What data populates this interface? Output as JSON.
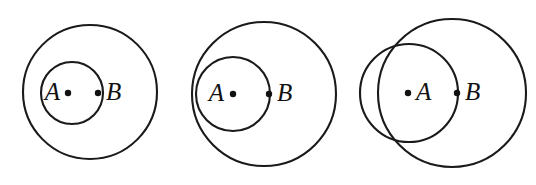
{
  "figure": {
    "background_color": "#ffffff",
    "stroke_color": "#1a1a1a",
    "label_color": "#111111",
    "width": 536,
    "height": 185,
    "panels": [
      {
        "id": "panel-1",
        "caption": "small circle inside large circle, passing through center region",
        "relationship": "nested",
        "circles": [
          {
            "name": "large-circle",
            "cx": 90,
            "cy": 92,
            "r": 67
          },
          {
            "name": "small-circle",
            "cx": 72,
            "cy": 93,
            "r": 31
          }
        ],
        "points": [
          {
            "name": "point-A",
            "label": "A",
            "cx": 68,
            "cy": 93,
            "label_side": "left",
            "label_x": 60,
            "label_y": 93
          },
          {
            "name": "point-B",
            "label": "B",
            "cx": 98,
            "cy": 93,
            "label_side": "right",
            "label_x": 106,
            "label_y": 93
          }
        ]
      },
      {
        "id": "panel-2",
        "caption": "small circle internally tangent to large circle at the left",
        "relationship": "internally-tangent",
        "circles": [
          {
            "name": "large-circle",
            "cx": 264,
            "cy": 94,
            "r": 72
          },
          {
            "name": "small-circle",
            "cx": 233,
            "cy": 94,
            "r": 37
          }
        ],
        "points": [
          {
            "name": "point-A",
            "label": "A",
            "cx": 233,
            "cy": 94,
            "label_side": "left",
            "label_x": 224,
            "label_y": 94
          },
          {
            "name": "point-B",
            "label": "B",
            "cx": 269,
            "cy": 94,
            "label_side": "right",
            "label_x": 277,
            "label_y": 94
          }
        ]
      },
      {
        "id": "panel-3",
        "caption": "two overlapping circles intersecting at two points",
        "relationship": "intersecting",
        "circles": [
          {
            "name": "large-circle",
            "cx": 452,
            "cy": 93,
            "r": 74
          },
          {
            "name": "small-circle",
            "cx": 409,
            "cy": 93,
            "r": 49
          }
        ],
        "points": [
          {
            "name": "point-A",
            "label": "A",
            "cx": 408,
            "cy": 93,
            "label_side": "right",
            "label_x": 416,
            "label_y": 93
          },
          {
            "name": "point-B",
            "label": "B",
            "cx": 457,
            "cy": 93,
            "label_side": "right",
            "label_x": 465,
            "label_y": 93
          }
        ]
      }
    ]
  }
}
